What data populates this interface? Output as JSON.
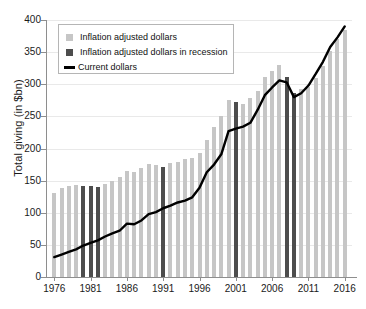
{
  "chart_data": {
    "type": "bar",
    "title": "",
    "xlabel": "",
    "ylabel": "Total giving (in $bn)",
    "ylim": [
      0,
      400
    ],
    "yticks": [
      0,
      50,
      100,
      150,
      200,
      250,
      300,
      350,
      400
    ],
    "xticks": [
      1976,
      1981,
      1986,
      1991,
      1996,
      2001,
      2006,
      2011,
      2016
    ],
    "xlim": [
      1975,
      2017
    ],
    "grid": true,
    "legend_position": "top-left",
    "categories": [
      1976,
      1977,
      1978,
      1979,
      1980,
      1981,
      1982,
      1983,
      1984,
      1985,
      1986,
      1987,
      1988,
      1989,
      1990,
      1991,
      1992,
      1993,
      1994,
      1995,
      1996,
      1997,
      1998,
      1999,
      2000,
      2001,
      2002,
      2003,
      2004,
      2005,
      2006,
      2007,
      2008,
      2009,
      2010,
      2011,
      2012,
      2013,
      2014,
      2015,
      2016
    ],
    "recession_years": [
      1980,
      1981,
      1982,
      1991,
      2001,
      2008,
      2009
    ],
    "series": [
      {
        "name": "Inflation adjusted dollars",
        "type": "bar",
        "color": "#c6c6c6",
        "recession_color": "#4d4d4d",
        "values": [
          131,
          139,
          141,
          143,
          142,
          141,
          140,
          145,
          150,
          156,
          165,
          163,
          170,
          176,
          175,
          172,
          177,
          179,
          183,
          186,
          193,
          213,
          233,
          250,
          275,
          273,
          270,
          278,
          290,
          312,
          320,
          330,
          311,
          287,
          293,
          296,
          310,
          329,
          352,
          370,
          385
        ]
      },
      {
        "name": "Current dollars",
        "type": "line",
        "color": "#000000",
        "values": [
          31,
          35,
          39,
          43,
          49,
          53,
          57,
          63,
          68,
          72,
          83,
          82,
          88,
          98,
          101,
          107,
          111,
          116,
          119,
          124,
          139,
          163,
          175,
          191,
          227,
          231,
          234,
          240,
          260,
          283,
          295,
          306,
          303,
          280,
          286,
          298,
          316,
          335,
          358,
          373,
          390
        ]
      }
    ],
    "legend": [
      {
        "label": "Inflation adjusted dollars",
        "swatch": "light-square"
      },
      {
        "label": "Inflation adjusted dollars in recession",
        "swatch": "dark-square"
      },
      {
        "label": "Current dollars",
        "swatch": "black-line"
      }
    ]
  },
  "colors": {
    "bar": "#c6c6c6",
    "bar_recession": "#4d4d4d",
    "line": "#000000",
    "axis": "#8e8e8e",
    "grid": "#e9e9e9",
    "text": "#1a1a1a"
  }
}
